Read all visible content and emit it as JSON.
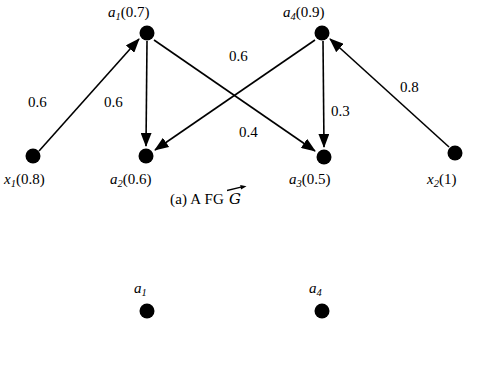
{
  "figure": {
    "caption_prefix": "(a) A",
    "caption_mid": "FG",
    "caption_symbol": "G",
    "caption_full": "(a) A FG G"
  },
  "graph_a": {
    "nodes": [
      {
        "id": "a1",
        "label_sym": "a",
        "label_sub": "1",
        "label_val": "(0.7)",
        "x": 147,
        "y": 33,
        "r": 7
      },
      {
        "id": "a4",
        "label_sym": "a",
        "label_sub": "4",
        "label_val": "(0.9)",
        "x": 322,
        "y": 33,
        "r": 7
      },
      {
        "id": "x1",
        "label_sym": "x",
        "label_sub": "1",
        "label_val": "(0.8)",
        "x": 33,
        "y": 156,
        "r": 7
      },
      {
        "id": "a2",
        "label_sym": "a",
        "label_sub": "2",
        "label_val": "(0.6)",
        "x": 146,
        "y": 156,
        "r": 7
      },
      {
        "id": "a3",
        "label_sym": "a",
        "label_sub": "3",
        "label_val": "(0.5)",
        "x": 324,
        "y": 157,
        "r": 7
      },
      {
        "id": "x2",
        "label_sym": "x",
        "label_sub": "2",
        "label_val": "(1)",
        "x": 455,
        "y": 153,
        "r": 7
      }
    ],
    "edges": [
      {
        "id": "x1-a1",
        "from": "x1",
        "to": "a1",
        "weight": "0.6",
        "label_x": 44,
        "label_y": 103
      },
      {
        "id": "a1-a2",
        "from": "a1",
        "to": "a2",
        "weight": "0.6",
        "label_x": 120,
        "label_y": 103
      },
      {
        "id": "a4-a2",
        "from": "a4",
        "to": "a2",
        "weight": "0.6",
        "label_x": 245,
        "label_y": 57
      },
      {
        "id": "a1-a3",
        "from": "a1",
        "to": "a3",
        "weight": "0.4",
        "label_x": 255,
        "label_y": 133
      },
      {
        "id": "a4-a3",
        "from": "a4",
        "to": "a3",
        "weight": "0.3",
        "label_x": 340,
        "label_y": 112
      },
      {
        "id": "x2-a4",
        "from": "x2",
        "to": "a4",
        "weight": "0.8",
        "label_x": 413,
        "label_y": 88
      }
    ]
  },
  "graph_b": {
    "nodes": [
      {
        "id": "b-a1",
        "label_sym": "a",
        "label_sub": "1",
        "label_val": "",
        "x": 147,
        "y": 311,
        "r": 7
      },
      {
        "id": "b-a4",
        "label_sym": "a",
        "label_sub": "4",
        "label_val": "",
        "x": 322,
        "y": 311,
        "r": 7
      }
    ]
  },
  "colors": {
    "ink": "#000000",
    "background": "#ffffff"
  }
}
